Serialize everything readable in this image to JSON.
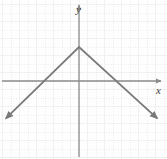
{
  "figure": {
    "name": "absolute-value-graph",
    "width": 167,
    "height": 159,
    "background_color": "#fefefe"
  },
  "axes": {
    "x_label": "x",
    "y_label": "y",
    "axis_color": "#8a8a8a",
    "origin_px": {
      "x": 79,
      "y": 81
    },
    "grid_spacing_px": 17
  },
  "grid": {
    "visible": true,
    "style": "dotted",
    "color": "#d8d8d8",
    "minor_color": "#ececec"
  },
  "curve": {
    "color": "#7a7a7a",
    "arrow_start": true,
    "arrow_end": true
  },
  "chart_data": {
    "type": "line",
    "title": "",
    "xlabel": "x",
    "ylabel": "y",
    "grid": true,
    "legend": null,
    "xlim": [
      -4.5,
      5
    ],
    "ylim": [
      -4.5,
      4.5
    ],
    "xticks": [
      -4,
      -3,
      -2,
      -1,
      0,
      1,
      2,
      3,
      4
    ],
    "yticks": [
      -4,
      -3,
      -2,
      -1,
      0,
      1,
      2,
      3,
      4
    ],
    "xticklabels": [],
    "yticklabels": [],
    "series": [
      {
        "name": "y = -|x| + 2",
        "vertex": [
          0,
          2
        ],
        "x_intercepts": [
          -2.5,
          2.5
        ],
        "x": [
          -4.3,
          0,
          4.6
        ],
        "y": [
          -2.2,
          2,
          -2.2
        ],
        "marker": "none",
        "arrows": "both"
      }
    ],
    "annotations": [
      {
        "text": "y",
        "x_px": 79,
        "y_px": 9,
        "role": "y-axis-label"
      },
      {
        "text": "x",
        "x_px": 159,
        "y_px": 90,
        "role": "x-axis-label"
      }
    ]
  }
}
